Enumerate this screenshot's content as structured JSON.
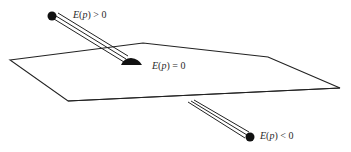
{
  "figure": {
    "plane": {
      "vertices": [
        [
          10,
          60
        ],
        [
          143,
          43
        ],
        [
          268,
          57
        ],
        [
          340,
          88
        ],
        [
          68,
          101
        ]
      ],
      "stroke": "#222222"
    },
    "points": [
      {
        "id": "above",
        "label_fn": "E",
        "label_arg": "p",
        "label_rel": "> 0",
        "label_text": "E(p) > 0",
        "ball": [
          52,
          16
        ],
        "rod_end": [
          118,
          58
        ]
      },
      {
        "id": "on",
        "label_fn": "E",
        "label_arg": "p",
        "label_rel": "= 0",
        "label_text": "E(p) = 0",
        "ball": [
          130,
          64
        ]
      },
      {
        "id": "below",
        "label_fn": "E",
        "label_arg": "p",
        "label_rel": "< 0",
        "label_text": "E(p) < 0",
        "ball": [
          250,
          137
        ],
        "rod_start": [
          190,
          101
        ]
      }
    ],
    "colors": {
      "ink": "#111111",
      "line": "#222222",
      "text": "#2a2a2a"
    }
  }
}
